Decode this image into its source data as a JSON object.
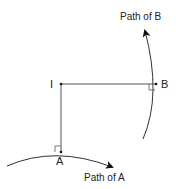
{
  "diagram": {
    "points": {
      "I": {
        "label": "I",
        "x": 61,
        "y": 84
      },
      "A": {
        "label": "A",
        "x": 61,
        "y": 152
      },
      "B": {
        "label": "B",
        "x": 156,
        "y": 84
      }
    },
    "paths": {
      "path_a": {
        "label": "Path of A"
      },
      "path_b": {
        "label": "Path of B"
      }
    },
    "colors": {
      "line": "#555555",
      "curve": "#333333",
      "arrow": "#111111",
      "text": "#222222"
    }
  }
}
